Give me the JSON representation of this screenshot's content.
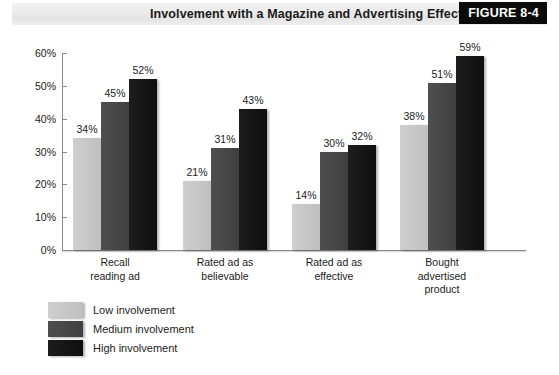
{
  "header": {
    "title": "Involvement with a Magazine and Advertising Effectiveness",
    "figure_badge": "FIGURE 8-4",
    "badge_bg": "#0b0b0b",
    "band_bg": "#eaeaea"
  },
  "chart_data": {
    "type": "bar",
    "title": "Involvement with a Magazine and Advertising Effectiveness",
    "xlabel": "",
    "ylabel": "",
    "ylim": [
      0,
      60
    ],
    "ytick_labels": [
      "0%",
      "10%",
      "20%",
      "30%",
      "40%",
      "50%",
      "60%"
    ],
    "ytick_values": [
      0,
      10,
      20,
      30,
      40,
      50,
      60
    ],
    "grid": false,
    "legend_position": "below-left",
    "categories": [
      "Recall\nreading ad",
      "Rated ad as\nbelievable",
      "Rated ad as\neffective",
      "Bought\nadvertised\nproduct"
    ],
    "series": [
      {
        "name": "Low involvement",
        "color": "#c6c6c6",
        "values": [
          34,
          21,
          14,
          38
        ],
        "labels": [
          "34%",
          "21%",
          "14%",
          "38%"
        ]
      },
      {
        "name": "Medium involvement",
        "color": "#474747",
        "values": [
          45,
          31,
          30,
          51
        ],
        "labels": [
          "45%",
          "31%",
          "30%",
          "51%"
        ]
      },
      {
        "name": "High involvement",
        "color": "#151515",
        "values": [
          52,
          43,
          32,
          59
        ],
        "labels": [
          "52%",
          "43%",
          "32%",
          "59%"
        ]
      }
    ]
  },
  "legend": {
    "items": [
      {
        "label": "Low involvement",
        "color": "#c6c6c6"
      },
      {
        "label": "Medium involvement",
        "color": "#474747"
      },
      {
        "label": "High involvement",
        "color": "#151515"
      }
    ]
  }
}
